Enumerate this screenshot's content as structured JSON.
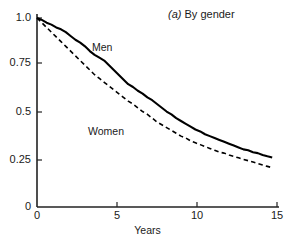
{
  "chart_data": {
    "type": "line",
    "title": "(a) By gender",
    "title_prefix": "(a)",
    "title_text": " By gender",
    "xlabel": "Years",
    "ylabel": "",
    "xlim": [
      0,
      15
    ],
    "ylim": [
      0,
      1.0
    ],
    "grid": false,
    "legend_position": "inline-annotation",
    "xticks": [
      0,
      5,
      10,
      15
    ],
    "xtick_labels": [
      "0",
      "5",
      "10",
      "15"
    ],
    "yticks": [
      0,
      0.25,
      0.5,
      0.75,
      1.0
    ],
    "ytick_labels": [
      "0",
      "0.25",
      "0.5",
      "0.75",
      "1.0"
    ],
    "series": [
      {
        "name": "Men",
        "style": "solid",
        "color": "#000000",
        "x": [
          0,
          0.3,
          0.6,
          0.9,
          1.2,
          1.5,
          1.8,
          2.1,
          2.4,
          2.7,
          3.0,
          3.3,
          3.6,
          3.9,
          4.2,
          4.5,
          4.8,
          5.1,
          5.4,
          5.7,
          6.0,
          6.3,
          6.6,
          6.9,
          7.2,
          7.5,
          7.8,
          8.1,
          8.4,
          8.7,
          9.0,
          9.3,
          9.6,
          9.9,
          10.2,
          10.5,
          10.8,
          11.1,
          11.4,
          11.7,
          12.0,
          12.3,
          12.6,
          12.9,
          13.2,
          13.5,
          13.8,
          14.1,
          14.4,
          14.7
        ],
        "y": [
          1.0,
          0.99,
          0.975,
          0.965,
          0.95,
          0.94,
          0.925,
          0.905,
          0.885,
          0.87,
          0.85,
          0.825,
          0.805,
          0.79,
          0.775,
          0.75,
          0.725,
          0.7,
          0.675,
          0.65,
          0.635,
          0.615,
          0.6,
          0.58,
          0.565,
          0.545,
          0.525,
          0.505,
          0.49,
          0.47,
          0.455,
          0.44,
          0.425,
          0.41,
          0.4,
          0.385,
          0.375,
          0.365,
          0.355,
          0.345,
          0.335,
          0.325,
          0.315,
          0.305,
          0.3,
          0.29,
          0.285,
          0.275,
          0.268,
          0.262
        ]
      },
      {
        "name": "Women",
        "style": "dashed",
        "color": "#000000",
        "x": [
          0,
          0.3,
          0.6,
          0.9,
          1.2,
          1.5,
          1.8,
          2.1,
          2.4,
          2.7,
          3.0,
          3.3,
          3.6,
          3.9,
          4.2,
          4.5,
          4.8,
          5.1,
          5.4,
          5.7,
          6.0,
          6.3,
          6.6,
          6.9,
          7.2,
          7.5,
          7.8,
          8.1,
          8.4,
          8.7,
          9.0,
          9.3,
          9.6,
          9.9,
          10.2,
          10.5,
          10.8,
          11.1,
          11.4,
          11.7,
          12.0,
          12.3,
          12.6,
          12.9,
          13.2,
          13.5,
          13.8,
          14.1,
          14.4,
          14.7
        ],
        "y": [
          1.0,
          0.975,
          0.95,
          0.925,
          0.9,
          0.875,
          0.85,
          0.825,
          0.8,
          0.775,
          0.75,
          0.725,
          0.7,
          0.68,
          0.66,
          0.64,
          0.62,
          0.6,
          0.58,
          0.56,
          0.545,
          0.525,
          0.505,
          0.49,
          0.47,
          0.45,
          0.435,
          0.42,
          0.405,
          0.39,
          0.375,
          0.365,
          0.35,
          0.34,
          0.33,
          0.32,
          0.31,
          0.3,
          0.29,
          0.285,
          0.275,
          0.268,
          0.26,
          0.252,
          0.245,
          0.238,
          0.23,
          0.222,
          0.215,
          0.208
        ]
      }
    ],
    "annotations": [
      {
        "text": "Men",
        "x": 3.6,
        "y": 0.84
      },
      {
        "text": "Women",
        "x": 3.3,
        "y": 0.44
      }
    ]
  },
  "axes": {
    "line_color": "#222222",
    "x_label": "Years",
    "x_tick_0": "0",
    "x_tick_1": "5",
    "x_tick_2": "10",
    "x_tick_3": "15",
    "y_tick_0": "0",
    "y_tick_1": "0.25",
    "y_tick_2": "0.5",
    "y_tick_3": "0.75",
    "y_tick_4": "1.0"
  },
  "labels": {
    "men": "Men",
    "women": "Women",
    "panel_letter": "(a)",
    "panel_rest": " By gender"
  }
}
